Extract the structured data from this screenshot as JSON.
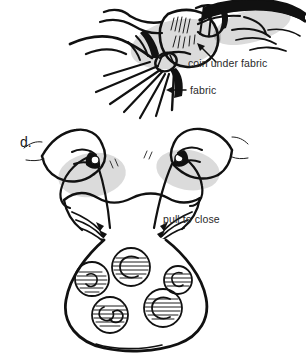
{
  "figure": {
    "background_color": "#ffffff",
    "ink_color": "#111111",
    "text_color": "#2a2a2a",
    "width": 306,
    "height": 353
  },
  "panels": [
    {
      "id": "panel-top",
      "step_label": "",
      "description": "Hands gathering fabric around a coin",
      "labels": [
        {
          "id": "coin-under-fabric",
          "text": "coin under fabric",
          "x": 188,
          "y": 67,
          "pointer": "curved-arrow-up-left"
        },
        {
          "id": "fabric",
          "text": "fabric",
          "x": 188,
          "y": 93,
          "pointer": "straight-arrow-left"
        }
      ]
    },
    {
      "id": "panel-d",
      "step_label": "d.",
      "step_label_x": 20,
      "step_label_y": 142,
      "description": "Two hands pulling drawstring cords to close the coin bag",
      "labels": [
        {
          "id": "pull-to-close",
          "text": "pull to close",
          "x": 163,
          "y": 219,
          "pointer": "none"
        }
      ]
    }
  ],
  "bag": {
    "id": "coin-bag",
    "description": "Gathered drawstring pouch with coins showing through fabric",
    "coin_count": 5,
    "coins": [
      {
        "cx": 92,
        "cy": 279,
        "r": 17
      },
      {
        "cx": 131,
        "cy": 267,
        "r": 19
      },
      {
        "cx": 178,
        "cy": 280,
        "r": 14
      },
      {
        "cx": 110,
        "cy": 315,
        "r": 18
      },
      {
        "cx": 163,
        "cy": 308,
        "r": 19
      }
    ]
  }
}
